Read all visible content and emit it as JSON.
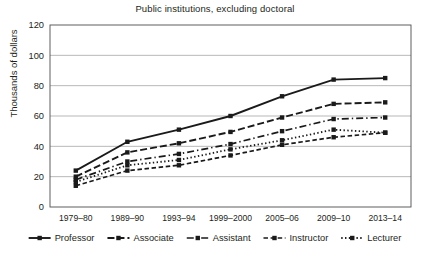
{
  "chart_data": {
    "type": "line",
    "title": "Public institutions, excluding doctoral",
    "xlabel": "",
    "ylabel": "Thousands of dollars",
    "ylim": [
      0,
      120
    ],
    "yticks": [
      0,
      20,
      40,
      60,
      80,
      100,
      120
    ],
    "grid": true,
    "legend_position": "bottom",
    "categories": [
      "1979–80",
      "1989–90",
      "1993–94",
      "1999–2000",
      "2005–06",
      "2009–10",
      "2013–14"
    ],
    "series": [
      {
        "name": "Professor",
        "dash": "none",
        "values": [
          24,
          43,
          51,
          60,
          73,
          84,
          85
        ]
      },
      {
        "name": "Associate",
        "dash": "dashed",
        "values": [
          20,
          36,
          42,
          49.5,
          59,
          68,
          69
        ]
      },
      {
        "name": "Assistant",
        "dash": "dash-dot",
        "values": [
          18,
          30,
          35,
          41.5,
          50,
          58,
          59
        ]
      },
      {
        "name": "Instructor",
        "dash": "short-dash",
        "values": [
          14,
          24,
          27.5,
          34,
          41,
          46,
          49
        ]
      },
      {
        "name": "Lecturer",
        "dash": "dotted",
        "values": [
          16.5,
          27.5,
          31,
          38,
          44,
          51,
          49
        ]
      }
    ]
  },
  "legend": {
    "items": [
      {
        "label": "Professor"
      },
      {
        "label": "Associate"
      },
      {
        "label": "Assistant"
      },
      {
        "label": "Instructor"
      },
      {
        "label": "Lecturer"
      }
    ]
  },
  "colors": {
    "ink": "#1a1a1a",
    "grid": "#9a9a9a",
    "frame": "#4d4d4d",
    "background": "#ffffff"
  }
}
